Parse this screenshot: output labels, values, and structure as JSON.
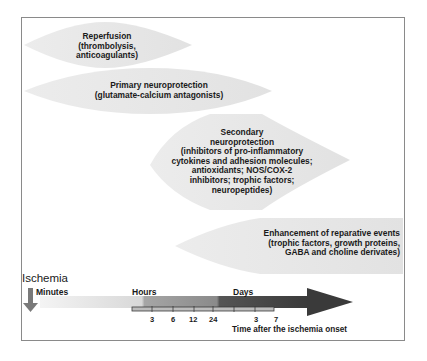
{
  "diagram": {
    "phases": [
      {
        "id": "reperfusion",
        "lines": [
          "Reperfusion",
          "(thrombolysis,",
          "anticoagulants)"
        ]
      },
      {
        "id": "primary",
        "lines": [
          "Primary neuroprotection",
          "(glutamate-calcium antagonists)"
        ]
      },
      {
        "id": "secondary",
        "lines": [
          "Secondary",
          "neuroprotection",
          "(inhibitors of pro-inflammatory",
          "cytokines and adhesion molecules;",
          "antioxidants; NOS/COX-2",
          "inhibitors; trophic factors;",
          "neuropeptides)"
        ]
      },
      {
        "id": "reparative",
        "lines": [
          "Enhancement of reparative events",
          "(trophic factors, growth proteins,",
          "GABA and choline derivates)"
        ]
      }
    ],
    "timeline": {
      "event_label": "Ischemia",
      "units": {
        "minutes": "Minutes",
        "hours": "Hours",
        "days": "Days"
      },
      "hour_ticks": [
        "3",
        "6",
        "12",
        "24"
      ],
      "day_ticks": [
        "3",
        "7"
      ],
      "axis_caption": "Time after the ischemia onset"
    },
    "colors": {
      "shape_fill": "#e6e6e6",
      "frame": "#8a8a8a",
      "arrow_dark": "#3a3a3a",
      "arrow_mid": "#8c8c8c",
      "arrow_light": "#f2f2f2",
      "down_arrow": "#7a7a7a"
    }
  }
}
